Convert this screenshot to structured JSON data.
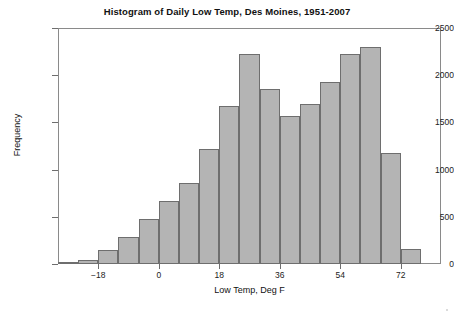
{
  "chart_data": {
    "type": "bar",
    "title": "Histogram of Daily Low Temp, Des Moines, 1951-2007",
    "xlabel": "Low Temp, Deg F",
    "ylabel": "Frequency",
    "xlim": [
      -30,
      84
    ],
    "ylim": [
      0,
      2500
    ],
    "bin_width": 6,
    "grid": false,
    "legend": null,
    "x_ticks": [
      -18,
      0,
      18,
      36,
      54,
      72
    ],
    "x_tick_labels": [
      "−18",
      "0",
      "18",
      "36",
      "54",
      "72"
    ],
    "y_ticks": [
      0,
      500,
      1000,
      1500,
      2000,
      2500
    ],
    "y_tick_labels": [
      "0",
      "500",
      "1000",
      "1500",
      "2000",
      "2500"
    ],
    "bin_edges": [
      -30,
      -24,
      -18,
      -12,
      -6,
      0,
      6,
      12,
      18,
      24,
      30,
      36,
      42,
      48,
      54,
      60,
      66,
      72,
      78,
      84
    ],
    "categories": [
      "-30 to -24",
      "-24 to -18",
      "-18 to -12",
      "-12 to -6",
      "-6 to 0",
      "0 to 6",
      "6 to 12",
      "12 to 18",
      "18 to 24",
      "24 to 30",
      "30 to 36",
      "36 to 42",
      "42 to 48",
      "48 to 54",
      "54 to 60",
      "60 to 66",
      "66 to 72",
      "72 to 78",
      "78 to 84"
    ],
    "values": [
      20,
      40,
      150,
      290,
      480,
      670,
      860,
      1220,
      1670,
      2220,
      1850,
      1570,
      1690,
      1930,
      2220,
      2300,
      1180,
      160,
      0
    ],
    "bar_color": "#b4b4b4",
    "bar_edge_color": "#6e6e6e"
  },
  "figure": {
    "title": "Histogram of Daily Low Temp, Des Moines, 1951-2007",
    "axis_color": "#8a8a8a",
    "background": "#ffffff"
  }
}
